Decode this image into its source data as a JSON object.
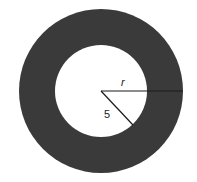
{
  "diagram": {
    "center": {
      "x": 101,
      "y": 91
    },
    "outer_circle": {
      "radius": 82,
      "fill": "#3a3a3a"
    },
    "inner_circle": {
      "radius": 46,
      "fill": "#ffffff"
    },
    "labels": {
      "outer_radius": "r",
      "inner_radius": "5"
    }
  }
}
